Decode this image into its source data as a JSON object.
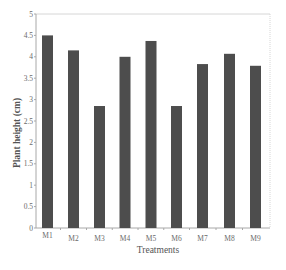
{
  "chart_data": {
    "type": "bar",
    "title": "",
    "xlabel": "Treatments",
    "ylabel": "Plant height (cm)",
    "categories": [
      "M1",
      "M2",
      "M3",
      "M4",
      "M5",
      "M6",
      "M7",
      "M8",
      "M9"
    ],
    "values": [
      4.5,
      4.15,
      2.85,
      4.0,
      4.37,
      2.85,
      3.83,
      4.07,
      3.79
    ],
    "ylim": [
      0,
      5
    ],
    "yticks": [
      0,
      0.5,
      1,
      1.5,
      2,
      2.5,
      3,
      3.5,
      4,
      4.5,
      5
    ],
    "ytick_labels": [
      "0",
      "0.5",
      "1",
      "1.5",
      "2",
      "2.5",
      "3",
      "3.5",
      "4",
      "4.5",
      "5"
    ],
    "grid": false,
    "legend": null,
    "colors": {
      "bar": "#4d4d4d",
      "axis": "#b5b5b5",
      "text": "#6a6a6a"
    }
  },
  "layout": {
    "plot_left": 36,
    "plot_right": 270,
    "plot_top": 14,
    "plot_bottom": 228,
    "bar_width": 11,
    "bar_centers": [
      47.5,
      73.5,
      99.5,
      125,
      151,
      176.5,
      202.5,
      229.5,
      255.5
    ]
  }
}
